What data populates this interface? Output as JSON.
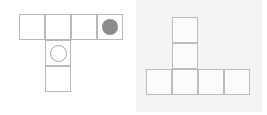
{
  "canvas": {
    "width": 267,
    "height": 115,
    "background_color": "#ffffff"
  },
  "figures": [
    {
      "id": "left-figure",
      "name": "left-polyomino",
      "panel": {
        "x": 0,
        "y": 0,
        "width": 133,
        "height": 115,
        "background_color": "#ffffff"
      },
      "grid": {
        "origin_x": 19,
        "origin_y": 14,
        "cell_size": 26,
        "line_color": "#b9b9b9",
        "cell_fill": "#ffffff"
      },
      "cells": [
        {
          "name": "cell-r0c0",
          "col": 0,
          "row": 0
        },
        {
          "name": "cell-r0c1",
          "col": 1,
          "row": 0
        },
        {
          "name": "cell-r0c2",
          "col": 2,
          "row": 0
        },
        {
          "name": "cell-r0c3",
          "col": 3,
          "row": 0
        },
        {
          "name": "cell-r1c1",
          "col": 1,
          "row": 1
        },
        {
          "name": "cell-r2c1",
          "col": 1,
          "row": 2
        }
      ],
      "tokens": [
        {
          "name": "filled-disc-token",
          "style": "filled",
          "color": "#8c8c8c",
          "col": 3,
          "row": 0,
          "diameter": 16
        },
        {
          "name": "outline-circle-token",
          "style": "outline",
          "color": "#a6a6a6",
          "col": 1,
          "row": 1,
          "diameter": 17
        }
      ]
    },
    {
      "id": "right-figure",
      "name": "right-polyomino",
      "panel": {
        "x": 136,
        "y": 0,
        "width": 126,
        "height": 112,
        "background_color": "#f4f4f4"
      },
      "grid": {
        "origin_x": 146,
        "origin_y": 17,
        "cell_size": 26,
        "line_color": "#bdbdbd",
        "cell_fill": "#fbfbfb"
      },
      "cells": [
        {
          "name": "cell-r0c1",
          "col": 1,
          "row": 0
        },
        {
          "name": "cell-r1c1",
          "col": 1,
          "row": 1
        },
        {
          "name": "cell-r2c0",
          "col": 0,
          "row": 2
        },
        {
          "name": "cell-r2c1",
          "col": 1,
          "row": 2
        },
        {
          "name": "cell-r2c2",
          "col": 2,
          "row": 2
        },
        {
          "name": "cell-r2c3",
          "col": 3,
          "row": 2
        }
      ],
      "tokens": []
    }
  ]
}
